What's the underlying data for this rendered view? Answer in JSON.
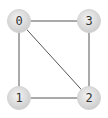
{
  "diagram": {
    "type": "undirected-graph",
    "nodes": [
      {
        "id": "0",
        "label": "0",
        "x": 19,
        "y": 21
      },
      {
        "id": "1",
        "label": "1",
        "x": 19,
        "y": 98
      },
      {
        "id": "2",
        "label": "2",
        "x": 89,
        "y": 98
      },
      {
        "id": "3",
        "label": "3",
        "x": 89,
        "y": 21
      }
    ],
    "edges": [
      {
        "from": "0",
        "to": "3"
      },
      {
        "from": "0",
        "to": "1"
      },
      {
        "from": "0",
        "to": "2"
      },
      {
        "from": "3",
        "to": "2"
      },
      {
        "from": "1",
        "to": "2"
      }
    ],
    "colors": {
      "edge": "#555555",
      "node_fill_center": "#f2f2f2",
      "node_fill_edge": "#cfcfcf",
      "node_stroke": "#d0d0d0",
      "label": "#333333"
    }
  }
}
